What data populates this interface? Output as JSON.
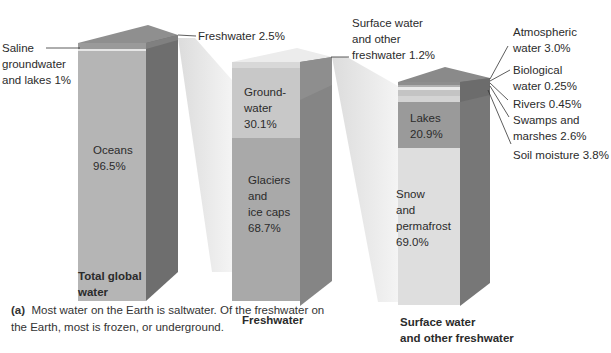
{
  "figure": {
    "bars": [
      {
        "title": "Total global water",
        "title_lines": [
          "Total global",
          "water"
        ],
        "segments": [
          {
            "label": "Oceans",
            "value": "96.5%"
          },
          {
            "label": "Saline groundwater and lakes",
            "value": "1%"
          },
          {
            "label": "Freshwater",
            "value": "2.5%"
          }
        ]
      },
      {
        "title": "Freshwater",
        "segments": [
          {
            "label": "Glaciers and ice caps",
            "value": "68.7%"
          },
          {
            "label": "Groundwater",
            "value": "30.1%"
          },
          {
            "label": "Surface water and other freshwater",
            "value": "1.2%"
          }
        ]
      },
      {
        "title": "Surface water and other freshwater",
        "title_lines": [
          "Surface water",
          "and other freshwater"
        ],
        "segments": [
          {
            "label": "Snow and permafrost",
            "value": "69.0%"
          },
          {
            "label": "Lakes",
            "value": "20.9%"
          },
          {
            "label": "Soil moisture",
            "value": "3.8%"
          },
          {
            "label": "Swamps and marshes",
            "value": "2.6%"
          },
          {
            "label": "Rivers",
            "value": "0.45%"
          },
          {
            "label": "Biological water",
            "value": "0.25%"
          },
          {
            "label": "Atmospheric water",
            "value": "3.0%"
          }
        ]
      }
    ],
    "labels": {
      "saline": [
        "Saline",
        "groundwater",
        "and lakes 1%"
      ],
      "freshwater_callout": "Freshwater 2.5%",
      "oceans": [
        "Oceans",
        "96.5%"
      ],
      "groundwater": [
        "Ground-",
        "water",
        "30.1%"
      ],
      "glaciers": [
        "Glaciers",
        "and",
        "ice caps",
        "68.7%"
      ],
      "surface_callout": [
        "Surface water",
        "and other",
        "freshwater 1.2%"
      ],
      "lakes": [
        "Lakes",
        "20.9%"
      ],
      "snow": [
        "Snow",
        "and",
        "permafrost",
        "69.0%"
      ],
      "atmospheric": [
        "Atmospheric",
        "water 3.0%"
      ],
      "biological": [
        "Biological",
        "water 0.25%"
      ],
      "rivers": "Rivers 0.45%",
      "swamps": [
        "Swamps and",
        "marshes 2.6%"
      ],
      "soil": "Soil moisture 3.8%"
    },
    "titles": {
      "total": [
        "Total global",
        "water"
      ],
      "fresh": "Freshwater",
      "surface": [
        "Surface water",
        "and other freshwater"
      ]
    },
    "caption": {
      "tag": "(a)",
      "text": "Most water on the Earth is saltwater. Of the freshwater on the Earth, most is frozen, or underground."
    }
  }
}
